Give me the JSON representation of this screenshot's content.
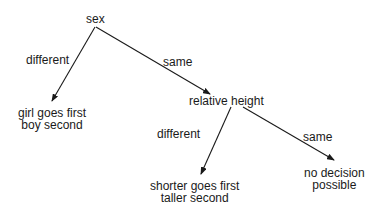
{
  "diagram": {
    "type": "decision-tree",
    "root": {
      "label": "sex",
      "branches": [
        {
          "edge_label": "different",
          "node": {
            "line1": "girl goes first",
            "line2": "boy second"
          }
        },
        {
          "edge_label": "same",
          "node": {
            "label": "relative height",
            "branches": [
              {
                "edge_label": "different",
                "node": {
                  "line1": "shorter goes first",
                  "line2": "taller second"
                }
              },
              {
                "edge_label": "same",
                "node": {
                  "line1": "no decision",
                  "line2": "possible"
                }
              }
            ]
          }
        }
      ]
    }
  },
  "colors": {
    "ink": "#1a1a1a",
    "background": "#ffffff"
  }
}
